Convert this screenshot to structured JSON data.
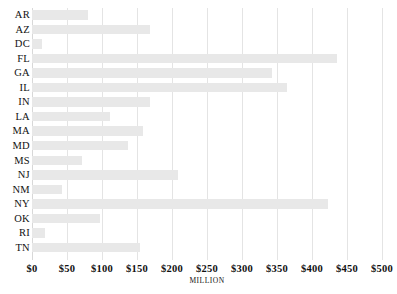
{
  "chart_data": {
    "type": "bar",
    "orientation": "horizontal",
    "title": "",
    "xlabel": "MILLION",
    "ylabel": "",
    "xlim": [
      0,
      500
    ],
    "xticks": [
      "$0",
      "$50",
      "$100",
      "$150",
      "$200",
      "$250",
      "$300",
      "$350",
      "$400",
      "$450",
      "$500"
    ],
    "xtick_values": [
      0,
      50,
      100,
      150,
      200,
      250,
      300,
      350,
      400,
      450,
      500
    ],
    "grid": true,
    "legend": "none",
    "bar_color": "#e8e8e8",
    "categories": [
      "AR",
      "AZ",
      "DC",
      "FL",
      "GA",
      "IL",
      "IN",
      "LA",
      "MA",
      "MD",
      "MS",
      "NJ",
      "NM",
      "NY",
      "OK",
      "RI",
      "TN"
    ],
    "values": [
      80,
      168,
      14,
      436,
      343,
      364,
      168,
      111,
      158,
      137,
      71,
      208,
      43,
      423,
      97,
      19,
      154
    ],
    "points": [
      {
        "category": "AR",
        "value": 80
      },
      {
        "category": "AZ",
        "value": 168
      },
      {
        "category": "DC",
        "value": 14
      },
      {
        "category": "FL",
        "value": 436
      },
      {
        "category": "GA",
        "value": 343
      },
      {
        "category": "IL",
        "value": 364
      },
      {
        "category": "IN",
        "value": 168
      },
      {
        "category": "LA",
        "value": 111
      },
      {
        "category": "MA",
        "value": 158
      },
      {
        "category": "MD",
        "value": 137
      },
      {
        "category": "MS",
        "value": 71
      },
      {
        "category": "NJ",
        "value": 208
      },
      {
        "category": "NM",
        "value": 43
      },
      {
        "category": "NY",
        "value": 423
      },
      {
        "category": "OK",
        "value": 97
      },
      {
        "category": "RI",
        "value": 19
      },
      {
        "category": "TN",
        "value": 154
      }
    ]
  }
}
